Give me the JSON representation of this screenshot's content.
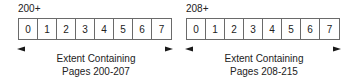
{
  "extents": [
    {
      "label": "200+",
      "cells": [
        "0",
        "1",
        "2",
        "3",
        "4",
        "5",
        "6",
        "7"
      ],
      "caption_line1": "Extent Containing",
      "caption_line2": "Pages 200-207"
    },
    {
      "label": "208+",
      "cells": [
        "0",
        "1",
        "2",
        "3",
        "4",
        "5",
        "6",
        "7"
      ],
      "caption_line1": "Extent Containing",
      "caption_line2": "Pages 208-215"
    }
  ],
  "colors": {
    "border": "#6a6a6a",
    "arrow_dark": "#1a1a1a",
    "arrow_green": "#5aa04a"
  }
}
